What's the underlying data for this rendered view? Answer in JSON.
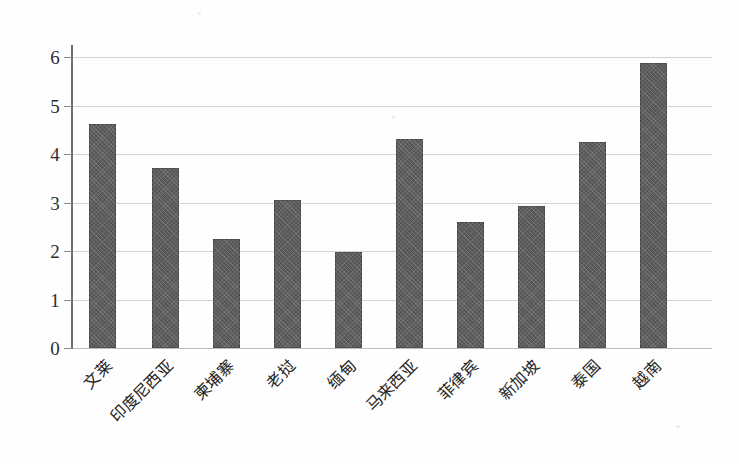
{
  "chart_data": {
    "type": "bar",
    "title": "",
    "subtitle": "",
    "xlabel": "",
    "ylabel": "",
    "categories": [
      "文莱",
      "印度尼西亚",
      "柬埔寨",
      "老挝",
      "缅甸",
      "马来西亚",
      "菲律宾",
      "新加坡",
      "泰国",
      "越南"
    ],
    "values": [
      4.43,
      3.57,
      2.16,
      2.93,
      1.9,
      4.14,
      2.5,
      2.82,
      4.08,
      5.65
    ],
    "series": [
      {
        "name": "",
        "values": [
          4.43,
          3.57,
          2.16,
          2.93,
          1.9,
          4.14,
          2.5,
          2.82,
          4.08,
          5.65
        ]
      }
    ],
    "ylim": [
      0,
      6
    ],
    "yticks": [
      0,
      1,
      2,
      3,
      4,
      5,
      6
    ],
    "ytick_labels": [
      "0",
      "1",
      "2",
      "3",
      "4",
      "5",
      "6"
    ],
    "grid": true,
    "grid_axis": "y",
    "legend": false,
    "legend_position": "none",
    "bar_color": "#5e5e5e",
    "grid_color": "#d2d2d2",
    "axis_color": "#6f6f6f",
    "background_color": "#ffffff",
    "annotations": []
  },
  "axis": {
    "y_tick_0": "0",
    "y_tick_1": "1",
    "y_tick_2": "2",
    "y_tick_3": "3",
    "y_tick_4": "4",
    "y_tick_5": "5",
    "y_tick_6": "6"
  },
  "categories_labels": {
    "c0": "文莱",
    "c1": "印度尼西亚",
    "c2": "柬埔寨",
    "c3": "老挝",
    "c4": "缅甸",
    "c5": "马来西亚",
    "c6": "菲律宾",
    "c7": "新加坡",
    "c8": "泰国",
    "c9": "越南"
  }
}
